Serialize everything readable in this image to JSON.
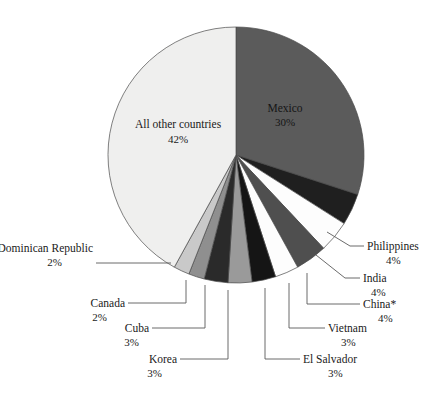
{
  "chart_data": {
    "type": "pie",
    "title": "",
    "subtitle": "",
    "xlabel": "",
    "ylabel": "",
    "legend_position": "callout-labels",
    "grid": false,
    "unit": "percent",
    "start_angle_deg": 0,
    "direction": "clockwise",
    "categories": [
      "Mexico",
      "Philippines",
      "India",
      "China*",
      "Vietnam",
      "El Salvador",
      "Korea",
      "Cuba",
      "Canada",
      "Dominican Republic",
      "All other countries"
    ],
    "values": [
      30,
      4,
      4,
      4,
      3,
      3,
      3,
      3,
      2,
      2,
      42
    ],
    "value_labels": [
      "30%",
      "4%",
      "4%",
      "4%",
      "3%",
      "3%",
      "3%",
      "3%",
      "2%",
      "2%",
      "42%"
    ],
    "colors": [
      "#5b5b5b",
      "#1f1f1f",
      "#fdfdfd",
      "#4f4f4f",
      "#fdfdfd",
      "#151515",
      "#9a9a9a",
      "#2a2a2a",
      "#8f8f8f",
      "#c9c9c9",
      "#efefee"
    ],
    "annotations": [
      "China* includes an asterisk footnote marker"
    ]
  },
  "slices": [
    {
      "name": "Mexico",
      "pct": "30%",
      "label": "Mexico",
      "label_pos": "inside"
    },
    {
      "name": "Philippines",
      "pct": "4%",
      "label": "Philippines",
      "label_pos": "callout-right"
    },
    {
      "name": "India",
      "pct": "4%",
      "label": "India",
      "label_pos": "callout-right"
    },
    {
      "name": "China*",
      "pct": "4%",
      "label": "China*",
      "label_pos": "callout-right"
    },
    {
      "name": "Vietnam",
      "pct": "3%",
      "label": "Vietnam",
      "label_pos": "callout-right"
    },
    {
      "name": "El Salvador",
      "pct": "3%",
      "label": "El Salvador",
      "label_pos": "callout-bottom"
    },
    {
      "name": "Korea",
      "pct": "3%",
      "label": "Korea",
      "label_pos": "callout-bottom"
    },
    {
      "name": "Cuba",
      "pct": "3%",
      "label": "Cuba",
      "label_pos": "callout-left"
    },
    {
      "name": "Canada",
      "pct": "2%",
      "label": "Canada",
      "label_pos": "callout-left"
    },
    {
      "name": "DominicanRepublic",
      "pct": "2%",
      "label": "Dominican Republic",
      "label_pos": "callout-left"
    },
    {
      "name": "AllOther",
      "pct": "42%",
      "label": "All other countries",
      "label_pos": "inside"
    }
  ]
}
